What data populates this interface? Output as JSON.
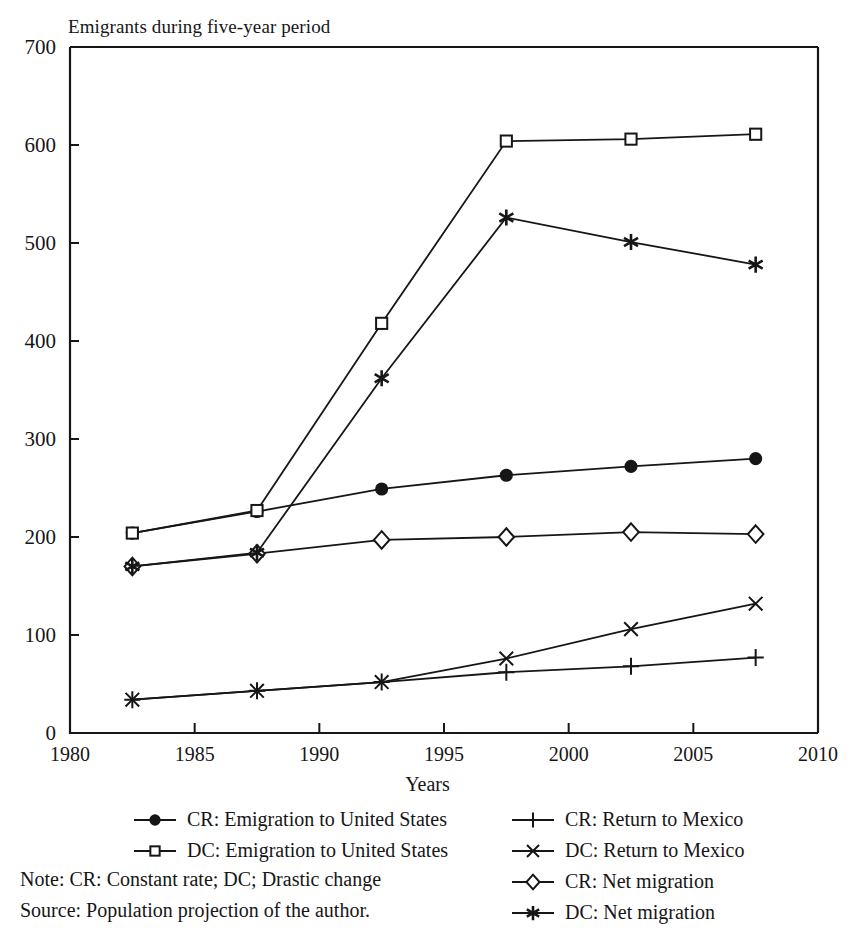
{
  "chart_data": {
    "type": "line",
    "title": "Emigrants during five-year period",
    "xlabel": "Years",
    "ylabel": "",
    "xlim": [
      1980,
      2010
    ],
    "ylim": [
      0,
      700
    ],
    "xticks": [
      1980,
      1985,
      1990,
      1995,
      2000,
      2005,
      2010
    ],
    "yticks": [
      0,
      100,
      200,
      300,
      400,
      500,
      600,
      700
    ],
    "grid": false,
    "legend_position": "below-plot-two-columns",
    "x": [
      1982.5,
      1987.5,
      1992.5,
      1997.5,
      2002.5,
      2007.5
    ],
    "series": [
      {
        "name": "CR: Emigration to United States",
        "marker": "filled-circle",
        "values": [
          204,
          226,
          249,
          263,
          272,
          280
        ]
      },
      {
        "name": "DC: Emigration to United States",
        "marker": "open-square",
        "values": [
          204,
          227,
          418,
          604,
          606,
          611
        ]
      },
      {
        "name": "CR: Return to Mexico",
        "marker": "plus",
        "values": [
          34,
          43,
          52,
          62,
          68,
          77
        ]
      },
      {
        "name": "DC: Return to Mexico",
        "marker": "cross",
        "values": [
          34,
          43,
          52,
          76,
          106,
          132
        ]
      },
      {
        "name": "CR: Net migration",
        "marker": "open-diamond",
        "values": [
          170,
          183,
          197,
          200,
          205,
          203
        ]
      },
      {
        "name": "DC: Net migration",
        "marker": "asterisk",
        "values": [
          170,
          184,
          362,
          526,
          501,
          478
        ]
      }
    ]
  },
  "legend": {
    "left_column": [
      {
        "label": "CR: Emigration to United States",
        "marker": "filled-circle"
      },
      {
        "label": "DC: Emigration to United States",
        "marker": "open-square"
      }
    ],
    "right_column": [
      {
        "label": "CR: Return to Mexico",
        "marker": "plus"
      },
      {
        "label": "DC: Return to Mexico",
        "marker": "cross"
      },
      {
        "label": "CR: Net migration",
        "marker": "open-diamond"
      },
      {
        "label": "DC: Net migration",
        "marker": "asterisk"
      }
    ]
  },
  "notes": {
    "note": "Note: CR: Constant rate; DC; Drastic change",
    "source": "Source: Population projection of the author."
  },
  "colors": {
    "ink": "#161616",
    "axis": "#1a1a1a",
    "background": "#ffffff"
  }
}
